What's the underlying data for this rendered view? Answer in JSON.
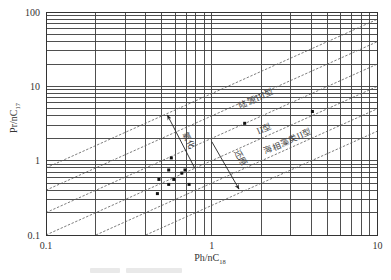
{
  "figure": {
    "axes": {
      "x_title_main": "Ph/nC",
      "x_title_sub": "18",
      "y_title_main": "Pr/nC",
      "y_title_sub": "17"
    }
  },
  "chart_data": {
    "type": "scatter",
    "title": "",
    "xlabel": "Ph/nC18",
    "ylabel": "Pr/nC17",
    "xscale": "log",
    "yscale": "log",
    "xlim": [
      0.1,
      10
    ],
    "ylim": [
      0.1,
      100
    ],
    "grid": "log-minor (1-9 per decade, both axes)",
    "xticks": [
      {
        "value": 0.1,
        "label": "0.1"
      },
      {
        "value": 1,
        "label": "1"
      },
      {
        "value": 10,
        "label": "10"
      }
    ],
    "yticks": [
      {
        "value": 0.1,
        "label": "0.1"
      },
      {
        "value": 1,
        "label": "1"
      },
      {
        "value": 10,
        "label": "10"
      },
      {
        "value": 100,
        "label": "100"
      }
    ],
    "series": [
      {
        "name": "samples",
        "marker": "square",
        "points": [
          [
            0.57,
            1.09
          ],
          [
            0.55,
            0.75
          ],
          [
            0.48,
            0.56
          ],
          [
            0.59,
            0.56
          ],
          [
            0.66,
            0.68
          ],
          [
            0.69,
            0.75
          ],
          [
            0.55,
            0.48
          ],
          [
            0.73,
            0.48
          ],
          [
            0.47,
            0.36
          ],
          [
            1.58,
            3.18
          ],
          [
            4.05,
            4.58
          ]
        ]
      }
    ],
    "reference_lines": [
      {
        "equation": "y = 8x",
        "k": 8,
        "style": "dashed"
      },
      {
        "equation": "y = 4x",
        "k": 4,
        "style": "dashed"
      },
      {
        "equation": "y = 2x",
        "k": 2,
        "style": "dashed"
      },
      {
        "equation": "y = x",
        "k": 1,
        "style": "dashed"
      },
      {
        "equation": "y = 0.5x",
        "k": 0.5,
        "style": "dashed"
      },
      {
        "equation": "y = 0.25x",
        "k": 0.25,
        "style": "dashed"
      }
    ],
    "annotations": [
      {
        "text": "陆源III型",
        "x": 1.86,
        "y": 6.75,
        "rotation": -24
      },
      {
        "text": "II型",
        "x": 2.08,
        "y": 2.66,
        "rotation": -24
      },
      {
        "text": "海相藻类II型",
        "x": 2.88,
        "y": 1.81,
        "rotation": -24
      },
      {
        "text": "氧化",
        "x": 0.72,
        "y": 1.84,
        "rotation": 62
      },
      {
        "text": "还原",
        "x": 1.49,
        "y": 1.08,
        "rotation": 60
      }
    ],
    "arrows": [
      {
        "label": "氧化",
        "from": [
          0.79,
          0.79
        ],
        "to": [
          0.54,
          4.1
        ]
      },
      {
        "label": "还原",
        "from": [
          1.0,
          1.8
        ],
        "to": [
          1.46,
          0.415
        ]
      }
    ]
  }
}
